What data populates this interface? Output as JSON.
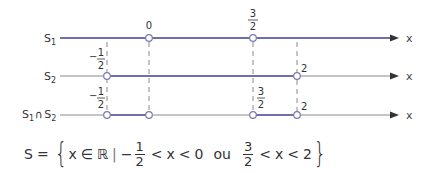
{
  "diagram": {
    "rows": [
      {
        "label": "S1",
        "label_main": "S",
        "label_sub": "1"
      },
      {
        "label": "S2",
        "label_main": "S",
        "label_sub": "2"
      },
      {
        "label": "S1 ∩ S2",
        "label_main": "S",
        "label_sub": "1",
        "cap": "∩",
        "label_main2": "S",
        "label_sub2": "2"
      }
    ],
    "axis_label": "x",
    "points": {
      "zero": "0",
      "three_halves": {
        "num": "3",
        "den": "2"
      },
      "minus_half": {
        "sign": "−",
        "num": "1",
        "den": "2"
      },
      "two": "2"
    },
    "colors": {
      "highlight": "#6f6fae",
      "base_line": "#8a8a8a",
      "dashed": "#8a8a8a",
      "circle_fill": "#ffffff"
    }
  },
  "formula": {
    "lhs": "S",
    "eq": "=",
    "open_brace": "{",
    "var": "x",
    "member": "∈",
    "set": "ℝ",
    "bar": "|",
    "minus": "−",
    "f1_num": "1",
    "f1_den": "2",
    "lt1": "<",
    "x1": "x",
    "lt2": "<",
    "zero": "0",
    "or": "ou",
    "f2_num": "3",
    "f2_den": "2",
    "lt3": "<",
    "x2": "x",
    "lt4": "<",
    "two": "2",
    "close_brace": "}"
  }
}
